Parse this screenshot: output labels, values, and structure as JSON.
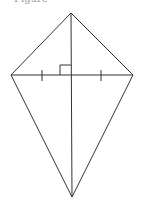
{
  "figure": {
    "caption": "Figure",
    "shape": "kite",
    "vertices": [
      "top",
      "left",
      "right",
      "bottom"
    ],
    "markings": {
      "right_angle": "diagonals intersect at right angle",
      "congruent_ticks": "horizontal diagonal bisected (two equal halves)"
    },
    "line_color": "#333333"
  }
}
